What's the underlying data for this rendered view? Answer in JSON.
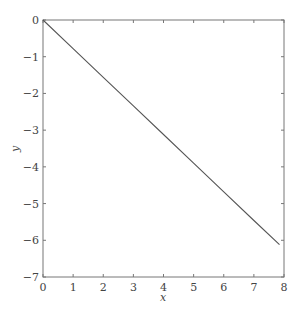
{
  "chart_data": {
    "type": "line",
    "title": "",
    "xlabel": "x",
    "ylabel": "y",
    "xlim": [
      0,
      8
    ],
    "ylim": [
      -7,
      0
    ],
    "xticks": [
      0,
      1,
      2,
      3,
      4,
      5,
      6,
      7,
      8
    ],
    "yticks": [
      0,
      -1,
      -2,
      -3,
      -4,
      -5,
      -6,
      -7
    ],
    "xtick_labels": [
      "0",
      "1",
      "2",
      "3",
      "4",
      "5",
      "6",
      "7",
      "8"
    ],
    "ytick_labels": [
      "0",
      "−1",
      "−2",
      "−3",
      "−4",
      "−5",
      "−6",
      "−7"
    ],
    "grid": false,
    "legend": null,
    "series": [
      {
        "name": "y",
        "x": [
          0,
          1,
          2,
          3,
          4,
          5,
          6,
          7,
          7.85
        ],
        "y": [
          0,
          -0.78,
          -1.56,
          -2.34,
          -3.12,
          -3.9,
          -4.68,
          -5.46,
          -6.12
        ]
      }
    ],
    "colors": {
      "line": "#555555",
      "axes": "#777777",
      "text": "#444444"
    }
  }
}
